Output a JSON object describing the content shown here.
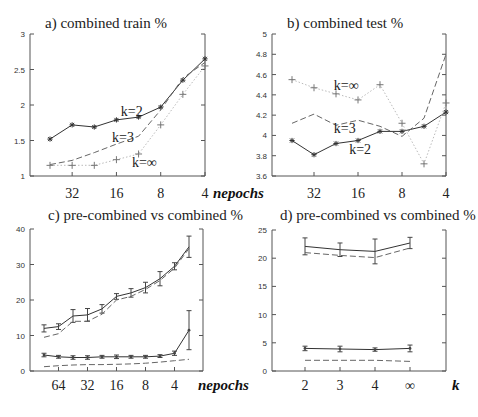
{
  "chart_data": [
    {
      "id": "a",
      "type": "line",
      "title": "a) combined train  %",
      "xlabel": "nepochs",
      "ylabel": "",
      "ylim": [
        1,
        3
      ],
      "yticks": [
        "1",
        "1.5",
        "2",
        "2.5",
        "3"
      ],
      "ytick_values": [
        1,
        1.5,
        2,
        2.5,
        3
      ],
      "x_positions": [
        0,
        1,
        2,
        3,
        4,
        5,
        6,
        7
      ],
      "xticks": [
        {
          "pos": 1,
          "label": "32"
        },
        {
          "pos": 3,
          "label": "16"
        },
        {
          "pos": 5,
          "label": "8"
        },
        {
          "pos": 7,
          "label": "4"
        }
      ],
      "series": [
        {
          "name": "k=2",
          "style": "solid",
          "marker": "star",
          "values": [
            1.52,
            1.72,
            1.69,
            1.79,
            1.83,
            1.97,
            2.35,
            2.65
          ]
        },
        {
          "name": "k=3",
          "style": "dashed",
          "marker": "none",
          "values": [
            1.16,
            1.22,
            1.33,
            1.45,
            1.56,
            1.93,
            2.38,
            2.6
          ]
        },
        {
          "name": "k=∞",
          "style": "dotted",
          "marker": "plus",
          "values": [
            1.15,
            1.15,
            1.15,
            1.23,
            1.31,
            1.72,
            2.15,
            2.55
          ]
        }
      ],
      "annotations": [
        {
          "text": "k=2",
          "x": 3.2,
          "y": 1.84
        },
        {
          "text": "k=3",
          "x": 2.8,
          "y": 1.48
        },
        {
          "text": "k=∞",
          "x": 3.7,
          "y": 1.13
        }
      ]
    },
    {
      "id": "b",
      "type": "line",
      "title": "b) combined test  %",
      "xlabel": "",
      "ylabel": "",
      "ylim": [
        3.6,
        5
      ],
      "yticks": [
        "3.6",
        "3.8",
        "4",
        "4.2",
        "4.4",
        "4.6",
        "4.8",
        "5"
      ],
      "ytick_values": [
        3.6,
        3.8,
        4.0,
        4.2,
        4.4,
        4.6,
        4.8,
        5.0
      ],
      "x_positions": [
        0,
        1,
        2,
        3,
        4,
        5,
        6,
        7
      ],
      "xticks": [
        {
          "pos": 1,
          "label": "32"
        },
        {
          "pos": 3,
          "label": "16"
        },
        {
          "pos": 5,
          "label": "8"
        },
        {
          "pos": 7,
          "label": "4"
        }
      ],
      "series": [
        {
          "name": "k=2",
          "style": "solid",
          "marker": "star",
          "values": [
            3.95,
            3.81,
            3.92,
            3.95,
            4.04,
            4.04,
            4.09,
            4.23
          ]
        },
        {
          "name": "k=3",
          "style": "dashed",
          "marker": "none",
          "values": [
            4.12,
            4.21,
            4.1,
            4.15,
            4.09,
            3.99,
            4.17,
            4.8
          ]
        },
        {
          "name": "k=∞",
          "style": "dotted",
          "marker": "plus",
          "values": [
            4.55,
            4.47,
            4.41,
            4.35,
            4.5,
            4.12,
            3.72,
            4.32
          ]
        }
      ],
      "annotations": [
        {
          "text": "k=∞",
          "x": 1.9,
          "y": 4.45
        },
        {
          "text": "k=3",
          "x": 1.9,
          "y": 4.02
        },
        {
          "text": "k=2",
          "x": 2.6,
          "y": 3.82
        }
      ]
    },
    {
      "id": "c",
      "type": "line",
      "title": "c) pre-combined vs combined  %",
      "xlabel": "nepochs",
      "ylabel": "",
      "ylim": [
        0,
        40
      ],
      "yticks": [
        "0",
        "10",
        "20",
        "30",
        "40"
      ],
      "ytick_values": [
        0,
        10,
        20,
        30,
        40
      ],
      "x_positions": [
        0,
        1,
        2,
        3,
        4,
        5,
        6,
        7,
        8,
        9,
        10
      ],
      "xticks": [
        {
          "pos": 1,
          "label": "64"
        },
        {
          "pos": 3,
          "label": "32"
        },
        {
          "pos": 5,
          "label": "16"
        },
        {
          "pos": 7,
          "label": "8"
        },
        {
          "pos": 9,
          "label": "4"
        }
      ],
      "series": [
        {
          "name": "upper-solid",
          "style": "solid",
          "marker": "none",
          "values": [
            12,
            12.5,
            15.5,
            15.8,
            17.5,
            21,
            22,
            23.5,
            26,
            29.5,
            35
          ],
          "errors": [
            1,
            0.8,
            1.8,
            1.8,
            1.2,
            0.8,
            1.2,
            1.5,
            2,
            1,
            3
          ]
        },
        {
          "name": "upper-dashed",
          "style": "dashed",
          "marker": "none",
          "values": [
            9.5,
            10.5,
            14,
            14,
            16,
            20,
            21,
            23,
            25.5,
            29,
            34.5
          ]
        },
        {
          "name": "lower-solid",
          "style": "solid",
          "marker": "dot",
          "values": [
            4.5,
            4,
            3.8,
            3.8,
            4,
            4,
            4,
            4,
            4.2,
            5,
            11.5
          ],
          "errors": [
            0.5,
            0.4,
            0.5,
            0.5,
            0.4,
            0.5,
            0.4,
            0.4,
            0.4,
            0.6,
            5.5
          ]
        },
        {
          "name": "lower-dashed",
          "style": "dashed",
          "marker": "none",
          "values": [
            1.2,
            1.5,
            1.7,
            1.8,
            1.8,
            1.9,
            2.0,
            2.2,
            2.5,
            2.9,
            3.3
          ]
        }
      ],
      "annotations": []
    },
    {
      "id": "d",
      "type": "line",
      "title": "d) pre-combined vs combined  %",
      "xlabel": "k",
      "ylabel": "",
      "ylim": [
        0,
        25
      ],
      "yticks": [
        "0",
        "5",
        "10",
        "15",
        "20",
        "25"
      ],
      "ytick_values": [
        0,
        5,
        10,
        15,
        20,
        25
      ],
      "x_positions": [
        0,
        1,
        2,
        3
      ],
      "xticks": [
        {
          "pos": 0,
          "label": "2"
        },
        {
          "pos": 1,
          "label": "3"
        },
        {
          "pos": 2,
          "label": "4"
        },
        {
          "pos": 3,
          "label": "∞"
        }
      ],
      "series": [
        {
          "name": "upper-solid",
          "style": "solid",
          "marker": "none",
          "values": [
            22.1,
            21.5,
            21.2,
            22.7
          ],
          "errors": [
            1.5,
            1.2,
            2.2,
            1.0
          ]
        },
        {
          "name": "upper-dashed",
          "style": "dashed",
          "marker": "none",
          "values": [
            21.0,
            20.5,
            20.1,
            21.8
          ]
        },
        {
          "name": "lower-solid",
          "style": "solid",
          "marker": "dot",
          "values": [
            4.0,
            3.9,
            3.8,
            4.0
          ],
          "errors": [
            0.4,
            0.5,
            0.3,
            0.6
          ]
        },
        {
          "name": "lower-dashed",
          "style": "dashed",
          "marker": "none",
          "values": [
            1.9,
            1.9,
            1.9,
            1.7
          ]
        }
      ],
      "annotations": []
    }
  ]
}
